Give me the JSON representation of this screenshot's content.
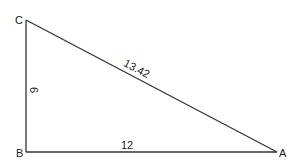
{
  "diagram": {
    "type": "right-triangle",
    "vertices": {
      "A": {
        "label": "A"
      },
      "B": {
        "label": "B"
      },
      "C": {
        "label": "C"
      }
    },
    "sides": {
      "BC": {
        "label": "6"
      },
      "BA": {
        "label": "12"
      },
      "CA": {
        "label": "13.42"
      }
    },
    "colors": {
      "stroke": "#333333",
      "text": "#222222",
      "background": "#ffffff"
    }
  }
}
